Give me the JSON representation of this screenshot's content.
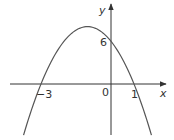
{
  "chart_data": {
    "type": "line",
    "title": "",
    "function": "y = -2x^2 - 4x + 6",
    "xlabel": "x",
    "ylabel": "y",
    "annotations": {
      "x_intercepts": [
        -3,
        1
      ],
      "y_intercept": 6,
      "origin_label": "0"
    },
    "tick_labels": {
      "x_left": "−3",
      "x_right": "1",
      "y": "6",
      "origin": "0"
    },
    "vertex": {
      "x": -1,
      "y": 8
    },
    "xlim": [
      -4.3,
      2.7
    ],
    "ylim": [
      -7.5,
      11.7
    ],
    "grid": false,
    "legend": false,
    "line_color": "#555555",
    "axis_color": "#333333"
  }
}
